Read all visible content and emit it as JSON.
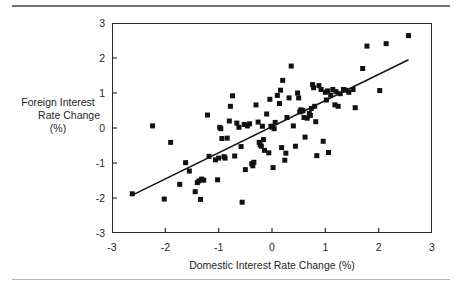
{
  "figure": {
    "has_top_rule": true,
    "has_bottom_rule": true,
    "background": "#ffffff",
    "marker_color": "#111111",
    "line_color": "#111111",
    "frame_color": "#2b2b2b"
  },
  "axis_titles": {
    "y_line1": "Foreign Interest",
    "y_line2": "Rate Change",
    "y_line3": "(%)",
    "x": "Domestic Interest Rate Change (%)"
  },
  "chart_data": {
    "type": "scatter",
    "title": "",
    "xlabel": "Domestic Interest Rate Change (%)",
    "ylabel": "Foreign Interest Rate Change (%)",
    "xlim": [
      -3,
      3
    ],
    "ylim": [
      -3,
      3
    ],
    "xticks": [
      -3,
      -2,
      -1,
      0,
      1,
      2,
      3
    ],
    "yticks": [
      -3,
      -2,
      -1,
      0,
      1,
      2,
      3
    ],
    "xtick_labels": [
      "-3",
      "-2",
      "-1",
      "0",
      "1",
      "2",
      "3"
    ],
    "ytick_labels": [
      "-3",
      "-2",
      "-1",
      "0",
      "1",
      "2",
      "3"
    ],
    "grid": false,
    "legend": null,
    "marker": "square",
    "marker_size_px": 5,
    "trendline": {
      "type": "linear-fit",
      "x_start": -2.62,
      "y_start": -1.92,
      "x_end": 2.56,
      "y_end": 1.95
    },
    "points": [
      [
        -2.62,
        -1.88
      ],
      [
        -2.24,
        0.06
      ],
      [
        -2.02,
        -2.03
      ],
      [
        -1.9,
        -0.41
      ],
      [
        -1.73,
        -1.61
      ],
      [
        -1.62,
        -0.99
      ],
      [
        -1.55,
        -1.23
      ],
      [
        -1.44,
        -1.82
      ],
      [
        -1.4,
        -1.56
      ],
      [
        -1.37,
        -1.51
      ],
      [
        -1.34,
        -2.04
      ],
      [
        -1.32,
        -1.46
      ],
      [
        -1.28,
        -1.49
      ],
      [
        -1.21,
        0.37
      ],
      [
        -1.18,
        -0.81
      ],
      [
        -1.06,
        -0.91
      ],
      [
        -1.02,
        -1.48
      ],
      [
        -1.0,
        -0.86
      ],
      [
        -0.98,
        0.02
      ],
      [
        -0.96,
        -0.02
      ],
      [
        -0.94,
        -0.3
      ],
      [
        -0.9,
        -0.82
      ],
      [
        -0.88,
        -0.86
      ],
      [
        -0.84,
        -0.29
      ],
      [
        -0.8,
        0.2
      ],
      [
        -0.78,
        0.62
      ],
      [
        -0.74,
        0.92
      ],
      [
        -0.7,
        -0.8
      ],
      [
        -0.66,
        0.14
      ],
      [
        -0.62,
        0.02
      ],
      [
        -0.58,
        -0.53
      ],
      [
        -0.56,
        -2.12
      ],
      [
        -0.52,
        0.1
      ],
      [
        -0.5,
        -1.19
      ],
      [
        -0.46,
        0.06
      ],
      [
        -0.42,
        0.12
      ],
      [
        -0.38,
        -1.02
      ],
      [
        -0.36,
        -1.08
      ],
      [
        -0.34,
        -0.98
      ],
      [
        -0.3,
        0.66
      ],
      [
        -0.26,
        0.17
      ],
      [
        -0.24,
        -0.41
      ],
      [
        -0.22,
        -0.48
      ],
      [
        -0.2,
        -0.52
      ],
      [
        -0.18,
        0.05
      ],
      [
        -0.16,
        -0.33
      ],
      [
        -0.14,
        -0.64
      ],
      [
        -0.1,
        0.4
      ],
      [
        -0.06,
        -0.71
      ],
      [
        -0.04,
        0.82
      ],
      [
        -0.02,
        0.05
      ],
      [
        0.0,
        0.02
      ],
      [
        0.02,
        -1.13
      ],
      [
        0.04,
        -0.02
      ],
      [
        0.06,
        0.16
      ],
      [
        0.1,
        0.93
      ],
      [
        0.14,
        0.7
      ],
      [
        0.16,
        1.08
      ],
      [
        0.18,
        -0.56
      ],
      [
        0.2,
        1.36
      ],
      [
        0.24,
        -0.92
      ],
      [
        0.26,
        -0.72
      ],
      [
        0.28,
        0.3
      ],
      [
        0.32,
        0.86
      ],
      [
        0.36,
        1.77
      ],
      [
        0.4,
        0.06
      ],
      [
        0.44,
        -0.52
      ],
      [
        0.48,
        1.0
      ],
      [
        0.5,
        0.86
      ],
      [
        0.52,
        0.46
      ],
      [
        0.54,
        0.52
      ],
      [
        0.56,
        0.48
      ],
      [
        0.58,
        0.5
      ],
      [
        0.6,
        0.3
      ],
      [
        0.62,
        -0.26
      ],
      [
        0.66,
        0.28
      ],
      [
        0.7,
        0.42
      ],
      [
        0.72,
        0.36
      ],
      [
        0.74,
        0.56
      ],
      [
        0.76,
        1.24
      ],
      [
        0.78,
        1.15
      ],
      [
        0.8,
        0.62
      ],
      [
        0.82,
        0.18
      ],
      [
        0.84,
        -0.79
      ],
      [
        0.88,
        1.21
      ],
      [
        0.92,
        1.1
      ],
      [
        0.96,
        -0.38
      ],
      [
        1.0,
        1.02
      ],
      [
        1.02,
        0.8
      ],
      [
        1.04,
        1.06
      ],
      [
        1.06,
        -0.7
      ],
      [
        1.1,
        0.94
      ],
      [
        1.14,
        1.1
      ],
      [
        1.18,
        0.66
      ],
      [
        1.2,
        1.04
      ],
      [
        1.24,
        0.62
      ],
      [
        1.28,
        0.98
      ],
      [
        1.34,
        1.1
      ],
      [
        1.38,
        1.08
      ],
      [
        1.44,
        1.02
      ],
      [
        1.52,
        1.1
      ],
      [
        1.56,
        0.58
      ],
      [
        1.7,
        1.7
      ],
      [
        1.78,
        2.34
      ],
      [
        2.02,
        1.07
      ],
      [
        2.14,
        2.41
      ],
      [
        2.56,
        2.64
      ]
    ]
  }
}
